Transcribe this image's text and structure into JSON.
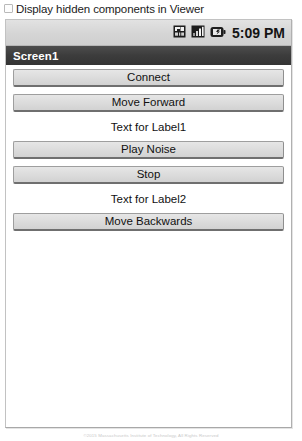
{
  "viewer_option": {
    "label": "Display hidden components in Viewer",
    "checked": false,
    "checkbox_icon": "checkbox-unchecked-icon"
  },
  "phone": {
    "status_bar": {
      "time": "5:09 PM",
      "icons": [
        {
          "name": "sd-card-icon",
          "label": "SD card"
        },
        {
          "name": "signal-bars-icon",
          "label": "Signal strength"
        },
        {
          "name": "battery-icon",
          "label": "Battery"
        }
      ]
    },
    "title_bar": {
      "screen_name": "Screen1"
    },
    "components": [
      {
        "type": "button",
        "name": "connect-button",
        "label": "Connect"
      },
      {
        "type": "button",
        "name": "move-forward-button",
        "label": "Move Forward"
      },
      {
        "type": "label",
        "name": "label1",
        "label": "Text for Label1"
      },
      {
        "type": "button",
        "name": "play-noise-button",
        "label": "Play Noise"
      },
      {
        "type": "button",
        "name": "stop-button",
        "label": "Stop"
      },
      {
        "type": "label",
        "name": "label2",
        "label": "Text for Label2"
      },
      {
        "type": "button",
        "name": "move-backwards-button",
        "label": "Move Backwards"
      }
    ]
  },
  "footer": {
    "credit": "©2015 Massachusetts Institute of Technology, All Rights Reserved"
  },
  "colors": {
    "title_bar_bg": "#3c3c3c",
    "status_bar_bg": "#d5d5d5",
    "button_face": "#dddddd",
    "screen_bg": "#ffffff",
    "frame_border": "#c2c2c2"
  }
}
